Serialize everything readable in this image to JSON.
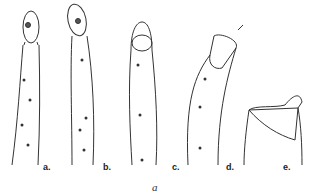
{
  "figure": {
    "panels": [
      {
        "label": "a.",
        "description": "elongated cell with oval head region and contractile vacuole"
      },
      {
        "label": "b.",
        "description": "elongated cell with tilted oval head"
      },
      {
        "label": "c.",
        "description": "elongated cell with rounded head, oral structure visible"
      },
      {
        "label": "d.",
        "description": "bent cell with open apical cap",
        "arrow": true
      },
      {
        "label": "e.",
        "description": "truncated cell top with saddle-shaped lid",
        "arrow": true
      }
    ],
    "caption": "a"
  },
  "colors": {
    "ink": "#333333",
    "background": "#ffffff"
  }
}
